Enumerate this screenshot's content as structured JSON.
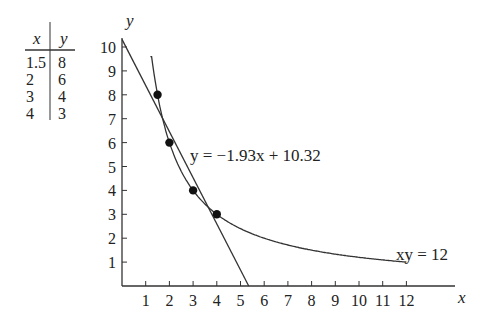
{
  "table": {
    "headers": [
      "x",
      "y"
    ],
    "rows": [
      [
        "1.5",
        "8"
      ],
      [
        "2",
        "6"
      ],
      [
        "3",
        "4"
      ],
      [
        "4",
        "3"
      ]
    ]
  },
  "chart_data": {
    "type": "scatter",
    "title": "",
    "xlabel": "x",
    "ylabel": "y",
    "xlim": [
      0,
      13
    ],
    "ylim": [
      0,
      10.5
    ],
    "x_ticks": [
      1,
      2,
      3,
      4,
      5,
      6,
      7,
      8,
      9,
      10,
      11,
      12
    ],
    "y_ticks": [
      1,
      2,
      3,
      4,
      5,
      6,
      7,
      8,
      9,
      10
    ],
    "grid": false,
    "points": [
      {
        "x": 1.5,
        "y": 8
      },
      {
        "x": 2,
        "y": 6
      },
      {
        "x": 3,
        "y": 4
      },
      {
        "x": 4,
        "y": 3
      }
    ],
    "series": [
      {
        "name": "y = −1.93x + 10.32",
        "type": "line",
        "slope": -1.93,
        "intercept": 10.32
      },
      {
        "name": "xy = 12",
        "type": "curve",
        "equation": "y = 12/x",
        "x_range": [
          1.2,
          12
        ]
      }
    ],
    "annotations": [
      {
        "text": "y = −1.93x + 10.32",
        "near": [
          3,
          6
        ]
      },
      {
        "text": "xy = 12",
        "near": [
          12,
          1
        ]
      }
    ]
  }
}
